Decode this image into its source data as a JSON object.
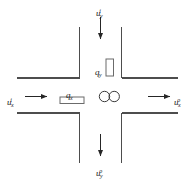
{
  "figure": {
    "background_color": "#ffffff",
    "line_color": "#4d4d4d",
    "text_color": "#1a1a1a"
  },
  "labels": {
    "inflow_top": {
      "base": "u",
      "sub": "y",
      "sup": "i"
    },
    "outflow_bottom": {
      "base": "u",
      "sub": "y",
      "sup": "o"
    },
    "inflow_left": {
      "base": "u",
      "sub": "x",
      "sup": "i"
    },
    "outflow_right": {
      "base": "u",
      "sub": "x",
      "sup": "o"
    },
    "block_vertical": {
      "base": "q",
      "sub": "y"
    },
    "block_horizontal": {
      "base": "q",
      "sub": "x"
    }
  },
  "elements": {
    "center_circles_count": 2,
    "arrows": [
      {
        "name": "arrow-top-down",
        "direction": "down"
      },
      {
        "name": "arrow-bottom-down",
        "direction": "down"
      },
      {
        "name": "arrow-left-right",
        "direction": "right"
      },
      {
        "name": "arrow-right-right",
        "direction": "right"
      }
    ]
  }
}
